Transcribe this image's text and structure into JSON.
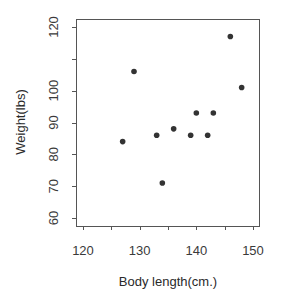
{
  "chart_data": {
    "type": "scatter",
    "title": "",
    "xlabel": "Body length(cm.)",
    "ylabel": "Weight(lbs)",
    "xlim": [
      120,
      150
    ],
    "ylim": [
      60,
      120
    ],
    "x_ticks": [
      120,
      125,
      130,
      135,
      140,
      145,
      150
    ],
    "x_tick_labels": [
      "120",
      "",
      "130",
      "",
      "140",
      "",
      "150"
    ],
    "y_ticks": [
      60,
      70,
      80,
      90,
      100,
      110,
      120
    ],
    "y_tick_labels": [
      "60",
      "70",
      "80",
      "90",
      "100",
      "",
      "120"
    ],
    "grid": false,
    "legend": null,
    "marker_color": "#333333",
    "points": [
      {
        "x": 127,
        "y": 84
      },
      {
        "x": 129,
        "y": 106
      },
      {
        "x": 133,
        "y": 86
      },
      {
        "x": 134,
        "y": 71
      },
      {
        "x": 136,
        "y": 88
      },
      {
        "x": 139,
        "y": 86
      },
      {
        "x": 140,
        "y": 93
      },
      {
        "x": 142,
        "y": 86
      },
      {
        "x": 143,
        "y": 93
      },
      {
        "x": 146,
        "y": 117
      },
      {
        "x": 148,
        "y": 101
      }
    ]
  },
  "layout": {
    "plot_left": 76,
    "plot_top": 19,
    "plot_right": 259,
    "plot_bottom": 226,
    "x_px_min": 83,
    "x_px_max": 253,
    "y_px_min": 218,
    "y_px_max": 27
  }
}
